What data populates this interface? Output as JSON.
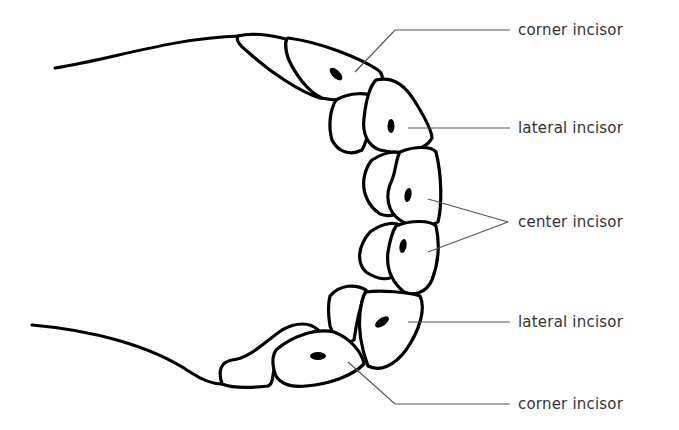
{
  "diagram": {
    "type": "dental-arch-labelled",
    "labels": [
      {
        "id": "corner-upper",
        "text": "corner incisor"
      },
      {
        "id": "lateral-upper",
        "text": "lateral incisor"
      },
      {
        "id": "center",
        "text": "center incisor"
      },
      {
        "id": "lateral-lower",
        "text": "lateral incisor"
      },
      {
        "id": "corner-lower",
        "text": "corner incisor"
      }
    ],
    "colors": {
      "line": "#000000",
      "leader": "#555555",
      "text": "#333333",
      "background": "#ffffff"
    }
  }
}
